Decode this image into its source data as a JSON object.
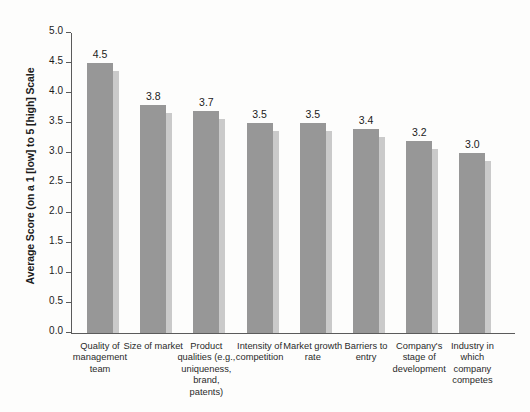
{
  "chart_data": {
    "type": "bar",
    "title": "",
    "subtitle": "",
    "xlabel": "",
    "ylabel": "Average Score (on a 1 [low] to 5 [high] Scale",
    "ylim": [
      0.0,
      5.0
    ],
    "grid": false,
    "legend": null,
    "legend_position": "none",
    "categories": [
      "Quality of management team",
      "Size of market",
      "Product qualities (e.g., uniqueness, brand, patents)",
      "Intensity of competition",
      "Market growth rate",
      "Barriers to entry",
      "Company's stage of development",
      "Industry in which company competes"
    ],
    "category_lines": [
      [
        "Quality of",
        "management",
        "team"
      ],
      [
        "Size of market"
      ],
      [
        "Product",
        "qualities (e.g.,",
        "uniqueness,",
        "brand, patents)"
      ],
      [
        "Intensity of",
        "competition"
      ],
      [
        "Market growth",
        "rate"
      ],
      [
        "Barriers to",
        "entry"
      ],
      [
        "Company's",
        "stage of",
        "development"
      ],
      [
        "Industry in",
        "which",
        "company",
        "competes"
      ]
    ],
    "values": [
      4.5,
      3.8,
      3.7,
      3.5,
      3.5,
      3.4,
      3.2,
      3.0
    ],
    "value_labels": [
      "4.5",
      "3.8",
      "3.7",
      "3.5",
      "3.5",
      "3.4",
      "3.2",
      "3.0"
    ],
    "y_ticks": [
      0.0,
      0.5,
      1.0,
      1.5,
      2.0,
      2.5,
      3.0,
      3.5,
      4.0,
      4.5,
      5.0
    ],
    "y_tick_labels": [
      "0.0",
      "0.5",
      "1.0",
      "1.5",
      "2.0",
      "2.5",
      "3.0",
      "3.5",
      "4.0",
      "4.5",
      "5.0"
    ],
    "colors": {
      "bar": "#979797",
      "bar_shadow": "#cacaca",
      "axis": "#5b5b5b",
      "text": "#1b1b1b",
      "background": "#fdfdfc"
    }
  }
}
